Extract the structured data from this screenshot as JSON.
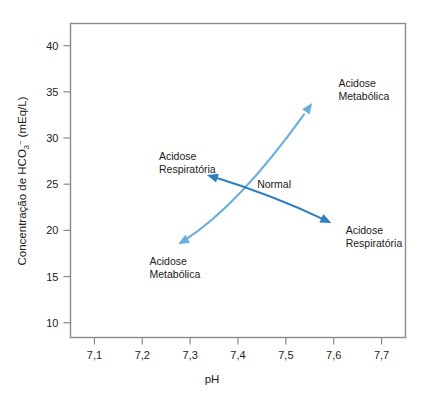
{
  "chart_data": {
    "type": "scatter",
    "title": "",
    "xlabel": "pH",
    "ylabel": "Concentração de HCO3− (mEq/L)",
    "ylabel_parts": {
      "lead": "Concentração de HCO",
      "sub": "3",
      "sup": "−",
      "tail": " (mEq/L)"
    },
    "xlim": [
      7.05,
      7.75
    ],
    "ylim": [
      8.4,
      42.4
    ],
    "xticks": [
      "7,1",
      "7,2",
      "7,3",
      "7,4",
      "7,5",
      "7,6",
      "7,7"
    ],
    "xtick_values": [
      7.1,
      7.2,
      7.3,
      7.4,
      7.5,
      7.6,
      7.7
    ],
    "yticks": [
      "10",
      "15",
      "20",
      "25",
      "30",
      "35",
      "40"
    ],
    "ytick_values": [
      10,
      15,
      20,
      25,
      30,
      35,
      40
    ],
    "grid": false,
    "legend": false,
    "colors": {
      "metabolic_arrow": "#6aaede",
      "respiratory_arrow": "#2f7fc1",
      "frame": "#8a8a8a",
      "text": "#1a1a1a",
      "background": "#ffffff"
    },
    "annotations": [
      {
        "id": "metabolic-high",
        "lines": [
          "Acidose",
          "Metabólica"
        ],
        "x": 7.61,
        "y": 35.5,
        "anchor": "start"
      },
      {
        "id": "respiratory-high",
        "lines": [
          "Acidose",
          "Respiratória"
        ],
        "x": 7.235,
        "y": 27.6,
        "anchor": "start"
      },
      {
        "id": "normal",
        "lines": [
          "Normal"
        ],
        "x": 7.44,
        "y": 24.6,
        "anchor": "start"
      },
      {
        "id": "respiratory-low",
        "lines": [
          "Acidose",
          "Respiratória"
        ],
        "x": 7.625,
        "y": 19.6,
        "anchor": "start"
      },
      {
        "id": "metabolic-low",
        "lines": [
          "Acidose",
          "Metabólica"
        ],
        "x": 7.215,
        "y": 16.3,
        "anchor": "start"
      }
    ],
    "arrows": [
      {
        "id": "metabolic-axis",
        "label": "Acidose Metabólica axis",
        "color": "#6aaede",
        "double_headed": true,
        "curved": true,
        "from": {
          "x": 7.275,
          "y": 18.5
        },
        "to": {
          "x": 7.555,
          "y": 33.8
        },
        "control": {
          "x": 7.4,
          "y": 22.3
        }
      },
      {
        "id": "respiratory-axis",
        "label": "Acidose Respiratória axis",
        "color": "#2f7fc1",
        "double_headed": true,
        "curved": true,
        "from": {
          "x": 7.335,
          "y": 26.0
        },
        "to": {
          "x": 7.595,
          "y": 20.8
        },
        "control": {
          "x": 7.47,
          "y": 23.9
        }
      }
    ]
  },
  "figure": {
    "name": "acid-base-balance-diagram"
  }
}
